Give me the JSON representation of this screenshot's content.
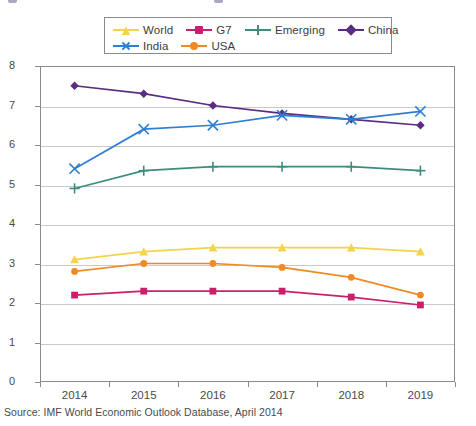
{
  "source_note": "Source: IMF World Economic Outlook Database, April 2014",
  "legend": {
    "rows": [
      [
        "World",
        "G7",
        "Emerging",
        "China"
      ],
      [
        "India",
        "USA"
      ]
    ]
  },
  "axis": {
    "y_ticks": [
      "8",
      "7",
      "6",
      "5",
      "4",
      "3",
      "2",
      "1",
      "0"
    ],
    "x_ticks": [
      "2014",
      "2015",
      "2016",
      "2017",
      "2018",
      "2019"
    ]
  },
  "colors": {
    "world": "#F5D34B",
    "g7": "#C9206E",
    "emerging": "#3E8C7E",
    "china": "#5B2C83",
    "india": "#2E7FD4",
    "usa": "#F08A24",
    "grid": "#c9c9c9",
    "frame": "#8a8a8a",
    "text": "#4a4a4a"
  },
  "chart_data": {
    "type": "line",
    "title": "",
    "xlabel": "",
    "ylabel": "",
    "x": [
      "2014",
      "2015",
      "2016",
      "2017",
      "2018",
      "2019"
    ],
    "ylim": [
      0,
      8
    ],
    "ytick_step": 1,
    "grid": true,
    "legend_position": "top-center",
    "series": [
      {
        "name": "World",
        "color": "#F5D34B",
        "marker": "triangle",
        "values": [
          3.1,
          3.3,
          3.4,
          3.4,
          3.4,
          3.3
        ]
      },
      {
        "name": "G7",
        "color": "#C9206E",
        "marker": "square",
        "values": [
          2.2,
          2.3,
          2.3,
          2.3,
          2.15,
          1.95
        ]
      },
      {
        "name": "Emerging",
        "color": "#3E8C7E",
        "marker": "plus",
        "values": [
          4.9,
          5.35,
          5.45,
          5.45,
          5.45,
          5.35
        ]
      },
      {
        "name": "China",
        "color": "#5B2C83",
        "marker": "diamond",
        "values": [
          7.5,
          7.3,
          7.0,
          6.8,
          6.65,
          6.5
        ]
      },
      {
        "name": "India",
        "color": "#2E7FD4",
        "marker": "x",
        "values": [
          5.4,
          6.4,
          6.5,
          6.75,
          6.65,
          6.85
        ]
      },
      {
        "name": "USA",
        "color": "#F08A24",
        "marker": "circle",
        "values": [
          2.8,
          3.0,
          3.0,
          2.9,
          2.65,
          2.2
        ]
      }
    ]
  }
}
